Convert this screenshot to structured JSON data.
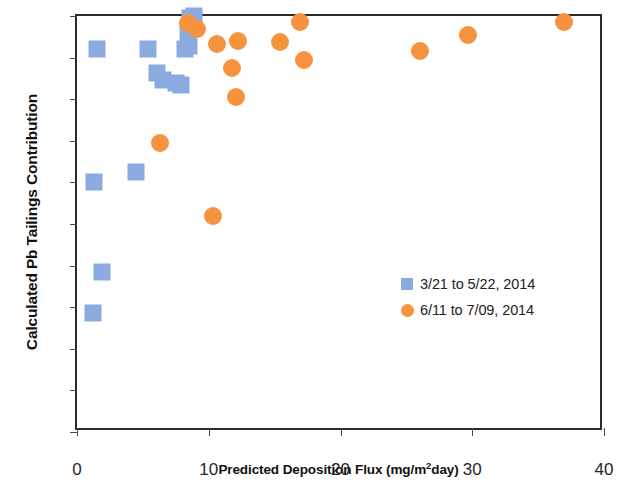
{
  "chart_data": {
    "type": "scatter",
    "title": "",
    "xlabel": "Predicted Deposition Flux (mg/m2day)",
    "xlabel_prefix": "Predicted Deposition Flux (mg/m",
    "xlabel_superscript": "2",
    "xlabel_suffix": "day)",
    "ylabel": "Calculated Pb Tailings Contribution",
    "xlim": [
      0,
      40
    ],
    "ylim": [
      0,
      1
    ],
    "xticks": [
      "0",
      "10",
      "20",
      "30",
      "40"
    ],
    "xtick_values": [
      0,
      10,
      20,
      30,
      40
    ],
    "yticks": [
      "0",
      "0.1",
      "0.2",
      "0.3",
      "0.4",
      "0.5",
      "0.6",
      "0.7",
      "0.8",
      "0.9",
      "1"
    ],
    "ytick_values": [
      0,
      0.1,
      0.2,
      0.3,
      0.4,
      0.5,
      0.6,
      0.7,
      0.8,
      0.9,
      1
    ],
    "grid": false,
    "legend_position": "inside lower-right",
    "colors": {
      "series_1": "#8BAADF",
      "series_2": "#F5933E",
      "axis": "#2b2b2b",
      "text": "#222222"
    },
    "series": [
      {
        "name": "3/21 to 5/22, 2014",
        "marker": "square",
        "color": "#8BAADF",
        "points": [
          [
            1.2,
            0.285
          ],
          [
            1.9,
            0.385
          ],
          [
            1.3,
            0.6
          ],
          [
            4.5,
            0.625
          ],
          [
            1.5,
            0.92
          ],
          [
            5.4,
            0.92
          ],
          [
            6.1,
            0.862
          ],
          [
            6.5,
            0.845
          ],
          [
            7.5,
            0.84
          ],
          [
            7.9,
            0.835
          ],
          [
            8.2,
            0.92
          ],
          [
            8.4,
            0.958
          ],
          [
            8.5,
            0.928
          ],
          [
            8.6,
            0.995
          ],
          [
            8.9,
            1.0
          ]
        ]
      },
      {
        "name": "6/11 to 7/09, 2014",
        "marker": "circle",
        "color": "#F5933E",
        "points": [
          [
            6.3,
            0.695
          ],
          [
            8.4,
            0.982
          ],
          [
            9.1,
            0.968
          ],
          [
            10.3,
            0.52
          ],
          [
            10.6,
            0.932
          ],
          [
            11.8,
            0.875
          ],
          [
            12.1,
            0.805
          ],
          [
            12.2,
            0.94
          ],
          [
            15.4,
            0.938
          ],
          [
            16.9,
            0.985
          ],
          [
            17.2,
            0.895
          ],
          [
            26.0,
            0.915
          ],
          [
            29.7,
            0.955
          ],
          [
            37.0,
            0.985
          ]
        ]
      }
    ]
  },
  "legend": {
    "entries": [
      {
        "label": "3/21 to 5/22, 2014",
        "marker": "square",
        "color": "#8BAADF"
      },
      {
        "label": "6/11 to 7/09, 2014",
        "marker": "circle",
        "color": "#F5933E"
      }
    ]
  }
}
